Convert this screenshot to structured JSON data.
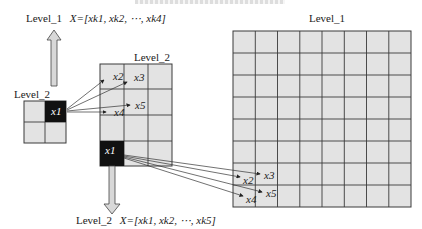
{
  "caption": {
    "visible": "cropped, illegible"
  },
  "labels": {
    "level1_top_left": "Level_1",
    "level1_top_left_formula": "X=[x",
    "level1_top_left_subs": [
      "k1",
      "k2",
      "k4"
    ],
    "level1_top_left_full": "X=[xk1, xk2, ⋯, xk4]",
    "level1_grid_title": "Level_1",
    "level2_grid_title": "Level_2",
    "level2_small_title": "Level_2",
    "level2_bottom": "Level_2",
    "level2_bottom_full": "X=[xk1, xk2, ⋯, xk5]"
  },
  "small_grid": {
    "rows": 2,
    "cols": 2,
    "dark_cell": "x1"
  },
  "mid_grid": {
    "rows": 4,
    "cols": 4,
    "points": {
      "x1": "x1",
      "x2": "x2",
      "x3": "x3",
      "x4": "x4",
      "x5": "x5"
    }
  },
  "big_grid": {
    "rows": 8,
    "cols": 8,
    "points": {
      "x2": "x2",
      "x3": "x3",
      "x4": "x4",
      "x5": "x5"
    }
  },
  "colors": {
    "cell": "#e3e3e3",
    "dark": "#111111",
    "line": "#3a3a3a",
    "arrow": "#d8d8d8"
  }
}
